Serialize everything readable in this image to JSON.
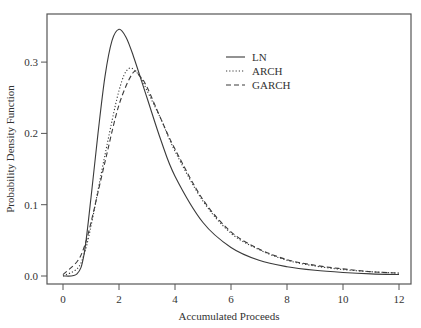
{
  "chart_data": {
    "type": "line",
    "title": "",
    "xlabel": "Accumulated Proceeds",
    "ylabel": "Probability Density Function",
    "xlim": [
      -0.6,
      12.4
    ],
    "ylim": [
      -0.012,
      0.365
    ],
    "xticks": [
      0,
      2,
      4,
      6,
      8,
      10,
      12
    ],
    "xtick_labels": [
      "0",
      "2",
      "4",
      "6",
      "8",
      "10",
      "12"
    ],
    "yticks": [
      0.0,
      0.1,
      0.2,
      0.3
    ],
    "ytick_labels": [
      "0.0",
      "0.1",
      "0.2",
      "0.3"
    ],
    "grid": false,
    "legend_position": "upper center-right, inside plot",
    "series": [
      {
        "name": "LN",
        "style": "solid",
        "x": [
          0,
          0.5,
          0.75,
          1,
          1.25,
          1.5,
          1.75,
          2,
          2.25,
          2.5,
          3,
          3.5,
          4,
          5,
          6,
          7,
          8,
          9,
          10,
          11,
          12
        ],
        "y": [
          0,
          0.003,
          0.03,
          0.11,
          0.2,
          0.28,
          0.33,
          0.346,
          0.335,
          0.31,
          0.25,
          0.19,
          0.14,
          0.075,
          0.04,
          0.022,
          0.013,
          0.008,
          0.005,
          0.003,
          0.002
        ]
      },
      {
        "name": "ARCH",
        "style": "dotted",
        "x": [
          0,
          0.5,
          0.75,
          1,
          1.5,
          2,
          2.35,
          2.75,
          3,
          3.5,
          4,
          5,
          6,
          7,
          8,
          9,
          10,
          11,
          12
        ],
        "y": [
          0,
          0.01,
          0.03,
          0.07,
          0.17,
          0.26,
          0.291,
          0.28,
          0.26,
          0.22,
          0.175,
          0.105,
          0.06,
          0.037,
          0.022,
          0.014,
          0.009,
          0.006,
          0.004
        ]
      },
      {
        "name": "GARCH",
        "style": "dashed",
        "x": [
          0,
          0.5,
          0.75,
          1,
          1.5,
          2,
          2.5,
          2.75,
          3,
          3.5,
          4,
          5,
          6,
          7,
          8,
          9,
          10,
          11,
          12
        ],
        "y": [
          0.002,
          0.02,
          0.04,
          0.075,
          0.16,
          0.24,
          0.285,
          0.28,
          0.265,
          0.22,
          0.178,
          0.107,
          0.062,
          0.038,
          0.023,
          0.015,
          0.01,
          0.006,
          0.004
        ]
      }
    ]
  },
  "legend": {
    "items": [
      {
        "label": "LN",
        "style": "solid"
      },
      {
        "label": "ARCH",
        "style": "dotted"
      },
      {
        "label": "GARCH",
        "style": "dashed"
      }
    ]
  },
  "colors": {
    "line": "#3a3a3a",
    "frame": "#555555",
    "text": "#333333",
    "background": "#ffffff"
  }
}
